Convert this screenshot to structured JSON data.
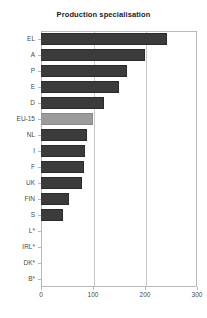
{
  "chart_data": {
    "type": "bar",
    "orientation": "horizontal",
    "title": "Production specialisation",
    "xlabel": "",
    "ylabel": "",
    "xlim": [
      0,
      300
    ],
    "xticks": [
      0,
      100,
      200,
      300
    ],
    "grid": "vertical-at-xticks",
    "legend": "none",
    "categories": [
      "EL",
      "A",
      "P",
      "E",
      "D",
      "EU-15",
      "NL",
      "I",
      "F",
      "UK",
      "FIN",
      "S",
      "L*",
      "IRL*",
      "DK*",
      "B*"
    ],
    "values": [
      242,
      200,
      166,
      150,
      122,
      100,
      89,
      85,
      83,
      79,
      54,
      43,
      0,
      0,
      0,
      0
    ],
    "highlight_category": "EU-15"
  },
  "colors": {
    "bar": "#3b3b3b",
    "bar_highlight": "#9b9b9b",
    "grid": "#c9c9c9",
    "frame": "#b9b9b9",
    "title_text": "#1a1a1a",
    "tick_text": "#4a4a4a",
    "background": "#ffffff"
  },
  "axes": {
    "x_tick_labels": [
      "0",
      "100",
      "200",
      "300"
    ],
    "y_tick_labels": [
      "EL",
      "A",
      "P",
      "E",
      "D",
      "EU-15",
      "NL",
      "I",
      "F",
      "UK",
      "FIN",
      "S",
      "L*",
      "IRL*",
      "DK*",
      "B*"
    ]
  }
}
